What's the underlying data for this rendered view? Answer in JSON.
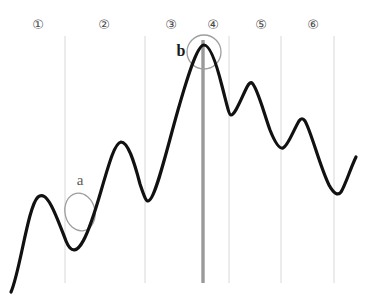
{
  "figure": {
    "background_color": "#ffffff",
    "width": 365,
    "height": 302,
    "top_clipped_text": "••••  •••••  ••••••  •••  ••••••  •••••",
    "curve_color": "#111111",
    "curve_width": 3.2,
    "gridline_color": "#d8d8d8",
    "gridline_width": 1,
    "highlight_line_color": "#9a9a9a",
    "highlight_line_width": 3.4,
    "annotation_color": "#9e9e9e",
    "annotation_width": 1.3
  },
  "markers": [
    {
      "label": "①",
      "number": "1",
      "x": 38,
      "y": 24
    },
    {
      "label": "②",
      "number": "2",
      "x": 104,
      "y": 24
    },
    {
      "label": "③",
      "number": "3",
      "x": 171,
      "y": 24
    },
    {
      "label": "④",
      "number": "4",
      "x": 213,
      "y": 24
    },
    {
      "label": "⑤",
      "number": "5",
      "x": 261,
      "y": 24
    },
    {
      "label": "⑥",
      "number": "6",
      "x": 313,
      "y": 24
    }
  ],
  "gridlines": [
    {
      "x": 65,
      "y_top": 36,
      "y_bottom": 283,
      "kind": "thin"
    },
    {
      "x": 145,
      "y_top": 36,
      "y_bottom": 283,
      "kind": "thin"
    },
    {
      "x": 229,
      "y_top": 36,
      "y_bottom": 283,
      "kind": "thin"
    },
    {
      "x": 281,
      "y_top": 36,
      "y_bottom": 283,
      "kind": "thin"
    },
    {
      "x": 334,
      "y_top": 36,
      "y_bottom": 283,
      "kind": "thin"
    }
  ],
  "highlight_line": {
    "x": 203,
    "y_top": 40,
    "y_bottom": 283
  },
  "annotations": [
    {
      "id": "a",
      "letter": "a",
      "letter_x": 80,
      "letter_y": 180,
      "shape": "ellipse",
      "cx": 80,
      "cy": 212,
      "rx": 15,
      "ry": 19,
      "rotation": -12
    },
    {
      "id": "b",
      "letter": "b",
      "letter_x": 181,
      "letter_y": 51,
      "shape": "circle",
      "cx": 204,
      "cy": 52,
      "rx": 17,
      "ry": 17,
      "rotation": 0
    }
  ],
  "chart_data": {
    "type": "line",
    "title": "",
    "subtitle": "",
    "xlabel": "",
    "ylabel": "",
    "grid": true,
    "legend_position": "none",
    "xlim": [
      0,
      365
    ],
    "ylim": [
      302,
      0
    ],
    "axis_note": "pixel coordinates, y inverted (smaller y = higher value)",
    "series": [
      {
        "name": "waveform",
        "color": "#111111",
        "path": "M 11 292 C 20 272, 28 206, 38 197 C 47 189, 56 215, 66 241 C 77 268, 90 229, 101 191 C 110 160, 115 143, 121 142 C 128 142, 134 161, 140 184 C 144 196, 146 201, 148 201 C 155 201, 166 152, 178 110 C 190 68, 198 45, 204 45 C 210 45, 216 62, 222 86 C 227 105, 229 115, 231 115 C 235 115, 241 99, 247 87 C 249 83, 251 82, 252 83 C 257 87, 263 110, 270 130 C 276 145, 280 149, 283 148 C 288 146, 293 131, 299 121 C 301 118, 303 118, 305 121 C 311 131, 320 167, 329 185 C 334 194, 338 196, 341 192 C 345 186, 351 167, 356 157",
        "keypoints": [
          {
            "x": 11,
            "y": 292,
            "kind": "start"
          },
          {
            "x": 38,
            "y": 197,
            "kind": "peak"
          },
          {
            "x": 66,
            "y": 241,
            "kind": "trough"
          },
          {
            "x": 121,
            "y": 142,
            "kind": "peak"
          },
          {
            "x": 148,
            "y": 201,
            "kind": "trough"
          },
          {
            "x": 204,
            "y": 45,
            "kind": "peak"
          },
          {
            "x": 231,
            "y": 115,
            "kind": "trough"
          },
          {
            "x": 251,
            "y": 83,
            "kind": "peak"
          },
          {
            "x": 283,
            "y": 148,
            "kind": "trough"
          },
          {
            "x": 303,
            "y": 118,
            "kind": "peak"
          },
          {
            "x": 339,
            "y": 194,
            "kind": "trough"
          },
          {
            "x": 356,
            "y": 157,
            "kind": "end"
          }
        ]
      }
    ],
    "annotation_labels": [
      "a",
      "b"
    ],
    "tick_labels": [
      "①",
      "②",
      "③",
      "④",
      "⑤",
      "⑥"
    ]
  }
}
